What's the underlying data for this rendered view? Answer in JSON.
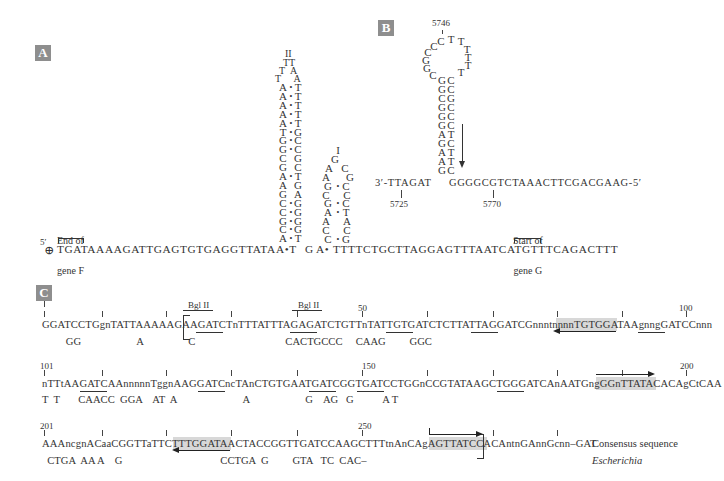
{
  "panels": {
    "A": {
      "label": "A",
      "five_prime": "5′",
      "end_of_gene_f": [
        "End of",
        "gene F"
      ],
      "start_of_gene_g": [
        "Start of",
        "gene G"
      ],
      "baseline_left": "TGATAAAAGATTGAGTGTGAGGTTATA",
      "baseline_mid1": "T G A",
      "baseline_right": "TTTTCTGCTTAGGAGTTTAATCATGTTTCAGACTTT",
      "hairpin1": {
        "loop": [
          "II",
          "TT",
          "T  A",
          "T     A"
        ],
        "stem": [
          [
            "A",
            "T"
          ],
          [
            "A",
            "T"
          ],
          [
            "A",
            "T"
          ],
          [
            "A",
            "T"
          ],
          [
            "A",
            "T"
          ],
          [
            "T",
            "G"
          ],
          [
            "G",
            "C"
          ],
          [
            "G",
            "C"
          ],
          [
            "C",
            "G"
          ],
          [
            "G",
            "C"
          ],
          [
            "A",
            "T"
          ],
          [
            "A",
            "G"
          ],
          [
            "G",
            "A"
          ],
          [
            "C",
            "G"
          ],
          [
            "C",
            "G"
          ],
          [
            "G",
            "G"
          ],
          [
            "C",
            "G"
          ],
          [
            "A",
            "T"
          ]
        ]
      },
      "hairpin2": {
        "rows": [
          "I",
          "G",
          "A  C",
          "A    G",
          "G•C",
          "C    C",
          "G•C",
          "A•T",
          "A    A",
          "C    C",
          "C•G"
        ]
      }
    },
    "B": {
      "label": "B",
      "pos_top": "5746",
      "loop": [
        "C",
        "C",
        "T",
        "T",
        "T",
        "T",
        "T",
        "T",
        "C",
        "G",
        "G",
        "C",
        "G",
        "C"
      ],
      "stem": [
        [
          "G",
          "C"
        ],
        [
          "G",
          "C"
        ],
        [
          "C",
          "G"
        ],
        [
          "G",
          "C"
        ],
        [
          "G",
          "C"
        ],
        [
          "G",
          "C"
        ],
        [
          "A",
          "T"
        ],
        [
          "G",
          "C"
        ],
        [
          "A",
          "T"
        ],
        [
          "A",
          "T"
        ],
        [
          "G",
          "C"
        ]
      ],
      "strand_left": "3′-TTAGAT",
      "strand_right": "GGGGCGTCTAAACTTCGACGAAG-5′",
      "pos_left": "5725",
      "pos_right": "5770"
    },
    "C": {
      "label": "C",
      "rows": [
        {
          "start_num": "",
          "mid_num": "50",
          "end_num": "100",
          "bgl_labels": [
            "Bgl II",
            "Bgl II"
          ],
          "consensus": "GGATCCTGgnTATTAAAAAGAAGATCTnTTTATTTAGAGATCTGTTnTATTGTGATCTCTTATTAGGATCGnnntnnnnTGTGGATAAgnngGATCCnnn",
          "escherichia": "         GG                     A                 C                                  CACTGCCC     CAAG         GGC"
        },
        {
          "start_num": "101",
          "mid_num": "150",
          "end_num": "200",
          "consensus": "nTTtAAGATCAAnnnnnTggnAAGGATCncTAnCTGTGAATGATCGGTGATCCTGGnCCGTATAAGCTGGGATCAnAATGngGGnTTATACACAgCtCAA",
          "escherichia": "T  T       CAACC  GGA    AT  A                         A                     G    AG   G           A T"
        },
        {
          "start_num": "201",
          "mid_num": "250",
          "consensus": "AAAncgnACaaCGGTTaTTCTTTGGATAACTACCGGTTGATCCAAGCTTTtnAnCAgAGTTATCCACAntnGAnnGcnn–GAT",
          "escherichia": "  CTGA  AA A    G                                     CCTGA  G         GTA   TC  CAC–",
          "legend_consensus": "Consensus sequence",
          "legend_escherichia": "Escherichia"
        }
      ]
    }
  }
}
